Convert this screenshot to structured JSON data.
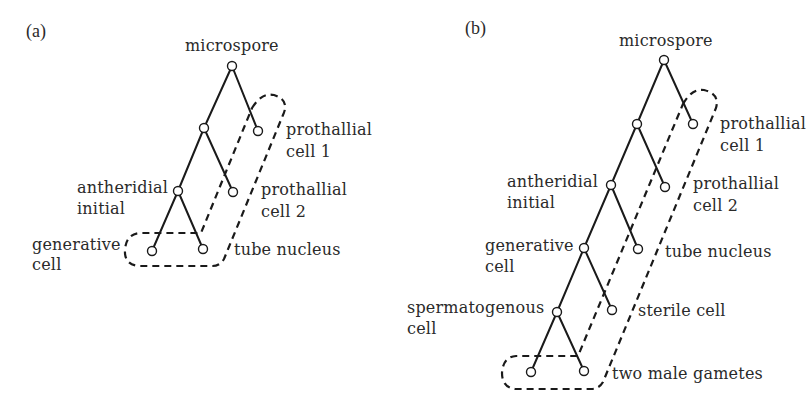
{
  "panels": [
    {
      "id": "a",
      "label": "(a)",
      "nodes": {
        "microspore": "microspore",
        "antheridial_initial": [
          "antheridial",
          "initial"
        ],
        "prothallial_cell_1": [
          "prothallial",
          "cell 1"
        ],
        "prothallial_cell_2": [
          "prothallial",
          "cell 2"
        ],
        "generative_cell": [
          "generative",
          "cell"
        ],
        "tube_nucleus": "tube nucleus"
      }
    },
    {
      "id": "b",
      "label": "(b)",
      "nodes": {
        "microspore": "microspore",
        "antheridial_initial": [
          "antheridial",
          "initial"
        ],
        "prothallial_cell_1": [
          "prothallial",
          "cell 1"
        ],
        "prothallial_cell_2": [
          "prothallial",
          "cell 2"
        ],
        "generative_cell": [
          "generative",
          "cell"
        ],
        "tube_nucleus": "tube nucleus",
        "spermatogenous_cell": [
          "spermatogenous",
          "cell"
        ],
        "sterile_cell": "sterile cell",
        "two_male_gametes": "two male gametes"
      }
    }
  ],
  "colors": {
    "line": "#1a1a1a",
    "text": "#2a2a2a",
    "background": "#ffffff"
  }
}
